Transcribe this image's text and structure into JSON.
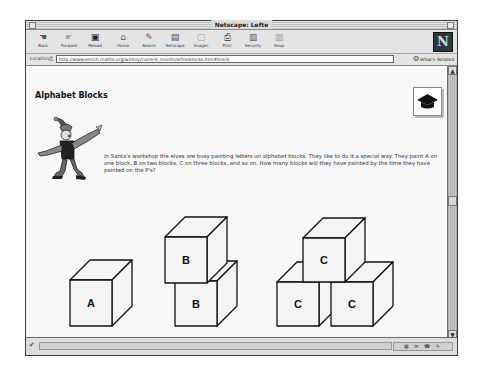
{
  "window": {
    "title": "Netscape: Lefte"
  },
  "toolbar": {
    "buttons": [
      {
        "label": "Back",
        "icon": "back-icon",
        "glyph": "☚"
      },
      {
        "label": "Forward",
        "icon": "forward-icon",
        "glyph": "☛"
      },
      {
        "label": "Reload",
        "icon": "reload-icon",
        "glyph": "▣"
      },
      {
        "label": "Home",
        "icon": "home-icon",
        "glyph": "⌂"
      },
      {
        "label": "Search",
        "icon": "search-icon",
        "glyph": "✎"
      },
      {
        "label": "Netscape",
        "icon": "netscape-icon",
        "glyph": "▤"
      },
      {
        "label": "Images",
        "icon": "images-icon",
        "glyph": "▢"
      },
      {
        "label": "Print",
        "icon": "print-icon",
        "glyph": "⎙"
      },
      {
        "label": "Security",
        "icon": "security-icon",
        "glyph": "🔒"
      },
      {
        "label": "Shop",
        "icon": "shop-icon",
        "glyph": "▥"
      }
    ],
    "logo": "N"
  },
  "location": {
    "label": "Location:",
    "url": "http://www.enrich.maths.org/wmtoy/current_month/lefmeblocks.htm#block",
    "related_label": "What's Related"
  },
  "page": {
    "title": "Alphabet Blocks",
    "story": "In Santa's workshop the elves are busy painting letters on alphabet blocks. They like to do it a special way. They paint A on one block, B on two blocks, C on three blocks, and so on. How many blocks will they have painted by the time they have painted on the P's?",
    "blocks": {
      "a": "A",
      "b_top": "B",
      "b_bottom": "B",
      "c_top": "C",
      "c_left": "C",
      "c_right": "C"
    }
  },
  "status": {
    "text": ""
  }
}
